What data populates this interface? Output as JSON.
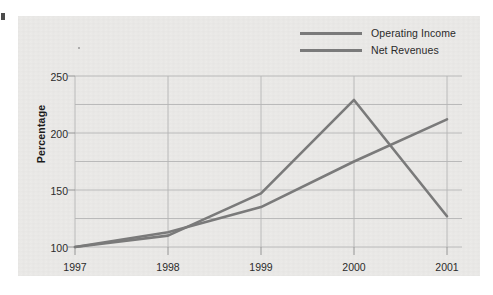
{
  "chart_data": {
    "type": "line",
    "title": "",
    "xlabel": "",
    "ylabel": "Percentage",
    "categories": [
      "1997",
      "1998",
      "1999",
      "2000",
      "2001"
    ],
    "ylim": [
      100,
      250
    ],
    "ytick_labels": [
      "100",
      "150",
      "200",
      "250"
    ],
    "ytick_values": [
      100,
      150,
      200,
      250
    ],
    "gridline_values": [
      100,
      125,
      150,
      175,
      200,
      225,
      250
    ],
    "grid": true,
    "legend_position": "top-right",
    "series": [
      {
        "name": "Operating Income",
        "color": "#7a7a7a",
        "values": [
          100,
          110,
          147,
          229,
          127
        ]
      },
      {
        "name": "Net Revenues",
        "color": "#7a7a7a",
        "values": [
          100,
          113,
          135,
          175,
          212
        ]
      }
    ]
  },
  "legend": {
    "items": [
      {
        "label": "Operating Income"
      },
      {
        "label": "Net Revenues"
      }
    ]
  },
  "axes": {
    "y_label": "Percentage",
    "y_ticks": [
      "250",
      "200",
      "150",
      "100"
    ],
    "x_ticks": [
      "1997",
      "1998",
      "1999",
      "2000",
      "2001"
    ]
  },
  "colors": {
    "panel_background": "#ecebe9",
    "page_background": "#ffffff",
    "line": "#7a7a7a",
    "grid": "#b4b4b4",
    "axis": "#8c8c8c",
    "text": "#2b2b2b"
  }
}
